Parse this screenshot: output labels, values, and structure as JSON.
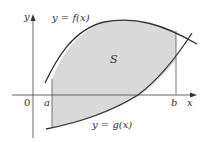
{
  "figure": {
    "labels": {
      "y_axis": "y",
      "x_axis": "x",
      "origin": "0",
      "a": "a",
      "b": "b",
      "region": "S",
      "f_curve": "y = f(x)",
      "g_curve": "y = g(x)"
    },
    "colors": {
      "shade": "#d9d9d9",
      "curve": "#333333",
      "axis": "#555555",
      "background": "#ffffff"
    }
  }
}
